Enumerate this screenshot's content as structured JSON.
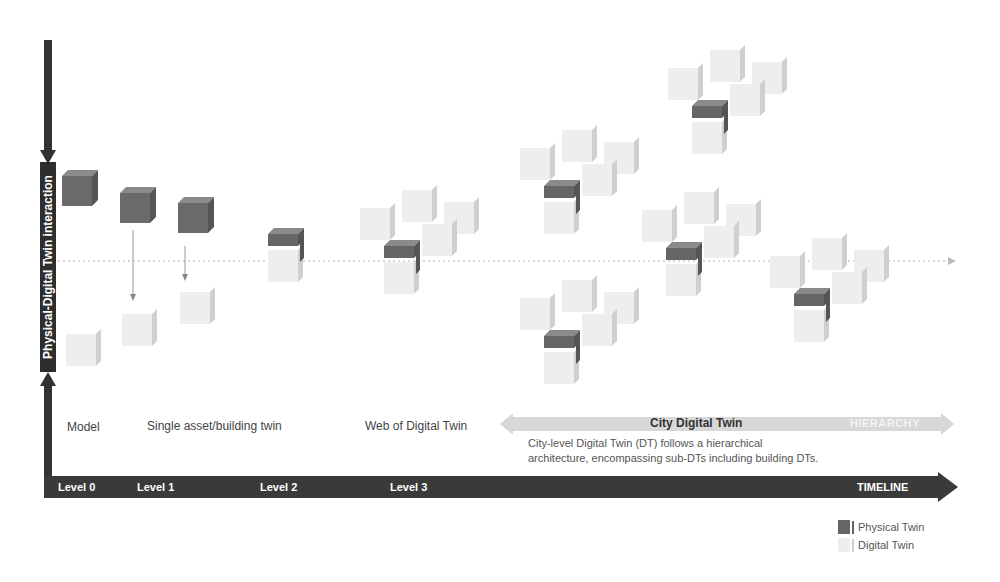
{
  "axes": {
    "vertical_label": "Physical-Digital Twin interaction",
    "horizontal_label": "TIMELINE",
    "levels": [
      {
        "label": "Level 0",
        "x": 58
      },
      {
        "label": "Level 1",
        "x": 137
      },
      {
        "label": "Level 2",
        "x": 260
      },
      {
        "label": "Level 3",
        "x": 390
      }
    ]
  },
  "stages": [
    {
      "label": "Model",
      "x": 67,
      "y": 420
    },
    {
      "label": "Single asset/building twin",
      "x": 147,
      "y": 419
    },
    {
      "label": "Web of Digital Twin",
      "x": 365,
      "y": 419
    }
  ],
  "city_twin": {
    "title": "City Digital Twin",
    "arrow_text": "HIERARCHY",
    "description_line1": "City-level Digital Twin (DT) follows a hierarchical",
    "description_line2": "architecture, encompassing sub-DTs including building DTs."
  },
  "legend": {
    "items": [
      {
        "label": "Physical Twin",
        "type": "physical"
      },
      {
        "label": "Digital Twin",
        "type": "digital"
      }
    ]
  },
  "colors": {
    "physical": "#6a6a6a",
    "physical_top": "#888888",
    "digital": "#eeeeee",
    "digital_side": "#cfcfcf",
    "axis": "#333333",
    "dotted_line": "#aaaaaa"
  }
}
